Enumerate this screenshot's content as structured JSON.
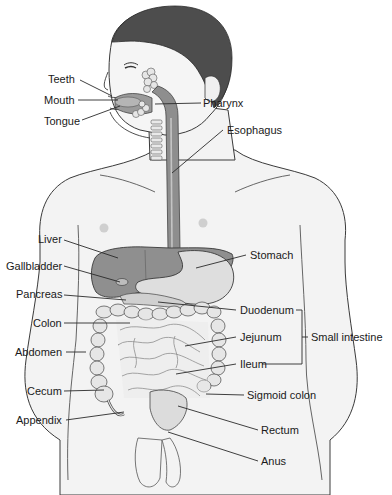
{
  "diagram": {
    "colors": {
      "skin": "#f1f1f1",
      "outline": "#3a3a3a",
      "hair": "#4a4a4a",
      "organ_dark": "#8c8c8c",
      "organ_mid": "#a9a9a9",
      "organ_light": "#d9d9d9",
      "intestine": "#e2e2e2",
      "leader_line": "#2a2a2a",
      "text": "#1a1a1a"
    },
    "labels_left": [
      {
        "id": "teeth",
        "text": "Teeth"
      },
      {
        "id": "mouth",
        "text": "Mouth"
      },
      {
        "id": "tongue",
        "text": "Tongue"
      },
      {
        "id": "liver",
        "text": "Liver"
      },
      {
        "id": "gallbladder",
        "text": "Gallbladder"
      },
      {
        "id": "pancreas",
        "text": "Pancreas"
      },
      {
        "id": "colon",
        "text": "Colon"
      },
      {
        "id": "abdomen",
        "text": "Abdomen"
      },
      {
        "id": "cecum",
        "text": "Cecum"
      },
      {
        "id": "appendix",
        "text": "Appendix"
      }
    ],
    "labels_right": [
      {
        "id": "pharynx",
        "text": "Pharynx"
      },
      {
        "id": "esophagus",
        "text": "Esophagus"
      },
      {
        "id": "stomach",
        "text": "Stomach"
      },
      {
        "id": "duodenum",
        "text": "Duodenum"
      },
      {
        "id": "jejunum",
        "text": "Jejunum"
      },
      {
        "id": "ileum",
        "text": "Ileum"
      },
      {
        "id": "sigmoid_colon",
        "text": "Sigmoid colon"
      },
      {
        "id": "rectum",
        "text": "Rectum"
      },
      {
        "id": "anus",
        "text": "Anus"
      }
    ],
    "group_bracket": {
      "text": "Small intestine",
      "members": [
        "Duodenum",
        "Jejunum",
        "Ileum"
      ]
    }
  }
}
